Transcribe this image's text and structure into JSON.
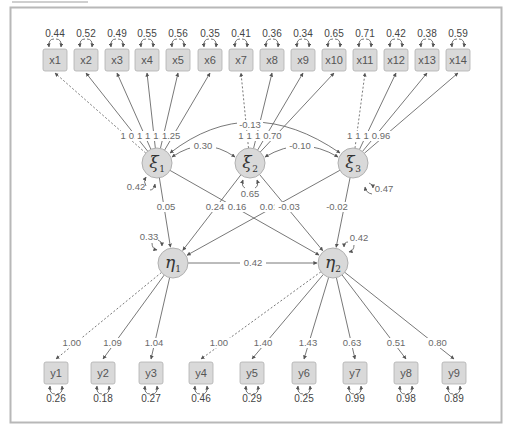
{
  "diagram": {
    "type": "structural-equation-model path diagram",
    "colors": {
      "background": "#ffffff",
      "frame": "#b8b8b8",
      "node_fill": "#d9d9d9",
      "node_stroke": "#b0b0b0",
      "line": "#555555",
      "text": "#555555"
    },
    "observed_x": [
      {
        "label": "x1",
        "variance": "0.44",
        "loading": "1.00",
        "fixed": true,
        "factor": "xi1"
      },
      {
        "label": "x2",
        "variance": "0.52",
        "loading": "0.78",
        "fixed": false,
        "factor": "xi1"
      },
      {
        "label": "x3",
        "variance": "0.49",
        "loading": "1.07",
        "fixed": false,
        "factor": "xi1"
      },
      {
        "label": "x4",
        "variance": "0.55",
        "loading": "1.25",
        "fixed": false,
        "factor": "xi1"
      },
      {
        "label": "x5",
        "variance": "0.56",
        "loading": "1.32",
        "fixed": false,
        "factor": "xi1"
      },
      {
        "label": "x6",
        "variance": "0.35",
        "loading": "1.25",
        "fixed": false,
        "factor": "xi1"
      },
      {
        "label": "x7",
        "variance": "0.41",
        "loading": "1.00",
        "fixed": true,
        "factor": "xi2"
      },
      {
        "label": "x8",
        "variance": "0.36",
        "loading": "1.00",
        "fixed": false,
        "factor": "xi2"
      },
      {
        "label": "x9",
        "variance": "0.34",
        "loading": "1.04",
        "fixed": false,
        "factor": "xi2"
      },
      {
        "label": "x10",
        "variance": "0.65",
        "loading": "0.70",
        "fixed": false,
        "factor": "xi2"
      },
      {
        "label": "x11",
        "variance": "0.71",
        "loading": "1.00",
        "fixed": true,
        "factor": "xi3"
      },
      {
        "label": "x12",
        "variance": "0.42",
        "loading": "1.00",
        "fixed": false,
        "factor": "xi3"
      },
      {
        "label": "x13",
        "variance": "0.38",
        "loading": "1.03",
        "fixed": false,
        "factor": "xi3"
      },
      {
        "label": "x14",
        "variance": "0.59",
        "loading": "0.96",
        "fixed": false,
        "factor": "xi3"
      }
    ],
    "exogenous": [
      {
        "symbol": "ξ",
        "subscript": "1",
        "variance": "0.42"
      },
      {
        "symbol": "ξ",
        "subscript": "2",
        "variance": "0.65"
      },
      {
        "symbol": "ξ",
        "subscript": "3",
        "variance": "0.47"
      }
    ],
    "covariances": {
      "xi1_xi2": "0.30",
      "xi2_xi3": "-0.10",
      "xi1_xi3": "-0.13"
    },
    "endogenous": [
      {
        "symbol": "η",
        "subscript": "1",
        "residual": "0.33"
      },
      {
        "symbol": "η",
        "subscript": "2",
        "residual": "0.42"
      }
    ],
    "structural_paths": {
      "xi1_eta1": "0.05",
      "xi1_eta2": "0.16",
      "xi2_eta1": "0.24",
      "xi2_eta2": "-0.03",
      "xi3_eta1": "0.01",
      "xi3_eta2": "-0.02",
      "eta1_eta2": "0.42"
    },
    "observed_y": [
      {
        "label": "y1",
        "variance": "0.26",
        "loading": "1.00",
        "fixed": true,
        "factor": "eta1"
      },
      {
        "label": "y2",
        "variance": "0.18",
        "loading": "1.09",
        "fixed": false,
        "factor": "eta1"
      },
      {
        "label": "y3",
        "variance": "0.27",
        "loading": "1.04",
        "fixed": false,
        "factor": "eta1"
      },
      {
        "label": "y4",
        "variance": "0.46",
        "loading": "1.00",
        "fixed": true,
        "factor": "eta2"
      },
      {
        "label": "y5",
        "variance": "0.29",
        "loading": "1.40",
        "fixed": false,
        "factor": "eta2"
      },
      {
        "label": "y6",
        "variance": "0.25",
        "loading": "1.43",
        "fixed": false,
        "factor": "eta2"
      },
      {
        "label": "y7",
        "variance": "0.99",
        "loading": "0.63",
        "fixed": false,
        "factor": "eta2"
      },
      {
        "label": "y8",
        "variance": "0.98",
        "loading": "0.51",
        "fixed": false,
        "factor": "eta2"
      },
      {
        "label": "y9",
        "variance": "0.89",
        "loading": "0.80",
        "fixed": false,
        "factor": "eta2"
      }
    ]
  }
}
